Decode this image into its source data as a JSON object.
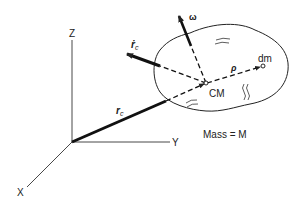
{
  "diagram": {
    "axes": {
      "x_label": "X",
      "y_label": "Y",
      "z_label": "Z"
    },
    "vectors": {
      "position": {
        "label": "r",
        "subscript": "c"
      },
      "velocity": {
        "label": "ṙ",
        "subscript": "c"
      },
      "angular_velocity": {
        "label": "ω"
      },
      "relative_position": {
        "label": "ρ"
      }
    },
    "points": {
      "center_of_mass": "CM",
      "mass_element": "dm"
    },
    "mass_label": "Mass = M",
    "colors": {
      "line": "#222222",
      "background": "#ffffff"
    }
  }
}
